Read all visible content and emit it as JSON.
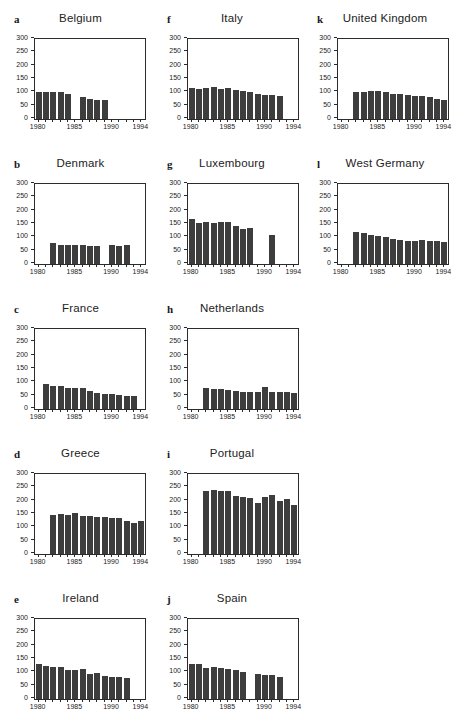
{
  "axis": {
    "ylim": [
      0,
      300
    ],
    "yticks": [
      0,
      50,
      100,
      150,
      200,
      250,
      300
    ],
    "years": [
      1980,
      1981,
      1982,
      1983,
      1984,
      1985,
      1986,
      1987,
      1988,
      1989,
      1990,
      1991,
      1992,
      1993,
      1994
    ],
    "xtick_positions": [
      0,
      5,
      10,
      14
    ],
    "xtick_labels": [
      "1980",
      "1985",
      "1990",
      "1994"
    ]
  },
  "style": {
    "bar_color": "#3d3d3d",
    "axis_color": "#2b2b2b",
    "background": "#ffffff"
  },
  "chart_data": [
    {
      "type": "bar",
      "id": "a",
      "title": "Belgium",
      "x": [
        1980,
        1981,
        1982,
        1983,
        1984,
        1985,
        1986,
        1987,
        1988,
        1989,
        1990,
        1991,
        1992,
        1993,
        1994
      ],
      "values": [
        100,
        100,
        100,
        103,
        95,
        null,
        83,
        76,
        73,
        72,
        null,
        null,
        null,
        null,
        null
      ],
      "ylim": [
        0,
        300
      ]
    },
    {
      "type": "bar",
      "id": "f",
      "title": "Italy",
      "x": [
        1980,
        1981,
        1982,
        1983,
        1984,
        1985,
        1986,
        1987,
        1988,
        1989,
        1990,
        1991,
        1992,
        1993,
        1994
      ],
      "values": [
        118,
        112,
        117,
        121,
        113,
        115,
        110,
        105,
        101,
        93,
        90,
        91,
        85,
        null,
        null
      ],
      "ylim": [
        0,
        300
      ]
    },
    {
      "type": "bar",
      "id": "k",
      "title": "United Kingdom",
      "x": [
        1980,
        1981,
        1982,
        1983,
        1984,
        1985,
        1986,
        1987,
        1988,
        1989,
        1990,
        1991,
        1992,
        1993,
        1994
      ],
      "values": [
        null,
        null,
        103,
        101,
        104,
        104,
        101,
        95,
        93,
        90,
        86,
        86,
        83,
        76,
        70
      ],
      "ylim": [
        0,
        300
      ]
    },
    {
      "type": "bar",
      "id": "b",
      "title": "Denmark",
      "x": [
        1980,
        1981,
        1982,
        1983,
        1984,
        1985,
        1986,
        1987,
        1988,
        1989,
        1990,
        1991,
        1992,
        1993,
        1994
      ],
      "values": [
        null,
        null,
        78,
        72,
        70,
        70,
        70,
        68,
        67,
        null,
        70,
        67,
        70,
        null,
        null
      ],
      "ylim": [
        0,
        300
      ]
    },
    {
      "type": "bar",
      "id": "g",
      "title": "Luxembourg",
      "x": [
        1980,
        1981,
        1982,
        1983,
        1984,
        1985,
        1986,
        1987,
        1988,
        1989,
        1990,
        1991,
        1992,
        1993,
        1994
      ],
      "values": [
        167,
        155,
        157,
        155,
        157,
        157,
        143,
        130,
        136,
        null,
        null,
        110,
        null,
        null,
        null
      ],
      "ylim": [
        0,
        300
      ]
    },
    {
      "type": "bar",
      "id": "l",
      "title": "West Germany",
      "x": [
        1980,
        1981,
        1982,
        1983,
        1984,
        1985,
        1986,
        1987,
        1988,
        1989,
        1990,
        1991,
        1992,
        1993,
        1994
      ],
      "values": [
        null,
        null,
        120,
        115,
        107,
        104,
        100,
        95,
        91,
        86,
        87,
        90,
        85,
        85,
        81
      ],
      "ylim": [
        0,
        300
      ]
    },
    {
      "type": "bar",
      "id": "c",
      "title": "France",
      "x": [
        1980,
        1981,
        1982,
        1983,
        1984,
        1985,
        1986,
        1987,
        1988,
        1989,
        1990,
        1991,
        1992,
        1993,
        1994
      ],
      "values": [
        null,
        95,
        87,
        86,
        80,
        80,
        79,
        67,
        61,
        58,
        55,
        54,
        49,
        48,
        null
      ],
      "ylim": [
        0,
        300
      ]
    },
    {
      "type": "bar",
      "id": "h",
      "title": "Netherlands",
      "x": [
        1980,
        1981,
        1982,
        1983,
        1984,
        1985,
        1986,
        1987,
        1988,
        1989,
        1990,
        1991,
        1992,
        1993,
        1994
      ],
      "values": [
        null,
        null,
        77,
        74,
        74,
        70,
        69,
        64,
        64,
        64,
        82,
        64,
        63,
        64,
        61
      ],
      "ylim": [
        0,
        300
      ]
    },
    {
      "type": "bar",
      "id": "d",
      "title": "Greece",
      "x": [
        1980,
        1981,
        1982,
        1983,
        1984,
        1985,
        1986,
        1987,
        1988,
        1989,
        1990,
        1991,
        1992,
        1993,
        1994
      ],
      "values": [
        null,
        null,
        145,
        150,
        145,
        152,
        143,
        142,
        137,
        140,
        135,
        135,
        125,
        118,
        125
      ],
      "ylim": [
        0,
        300
      ]
    },
    {
      "type": "bar",
      "id": "i",
      "title": "Portugal",
      "x": [
        1980,
        1981,
        1982,
        1983,
        1984,
        1985,
        1986,
        1987,
        1988,
        1989,
        1990,
        1991,
        1992,
        1993,
        1994
      ],
      "values": [
        null,
        null,
        238,
        240,
        238,
        236,
        218,
        213,
        210,
        192,
        215,
        220,
        200,
        205,
        185
      ],
      "ylim": [
        0,
        300
      ]
    },
    {
      "type": "bar",
      "id": "e",
      "title": "Ireland",
      "x": [
        1980,
        1981,
        1982,
        1983,
        1984,
        1985,
        1986,
        1987,
        1988,
        1989,
        1990,
        1991,
        1992,
        1993,
        1994
      ],
      "values": [
        133,
        125,
        121,
        121,
        108,
        108,
        111,
        95,
        96,
        88,
        84,
        81,
        80,
        null,
        null
      ],
      "ylim": [
        0,
        300
      ]
    },
    {
      "type": "bar",
      "id": "j",
      "title": "Spain",
      "x": [
        1980,
        1981,
        1982,
        1983,
        1984,
        1985,
        1986,
        1987,
        1988,
        1989,
        1990,
        1991,
        1992,
        1993,
        1994
      ],
      "values": [
        133,
        133,
        118,
        120,
        117,
        113,
        107,
        100,
        null,
        95,
        90,
        89,
        83,
        null,
        null
      ],
      "ylim": [
        0,
        300
      ]
    }
  ]
}
